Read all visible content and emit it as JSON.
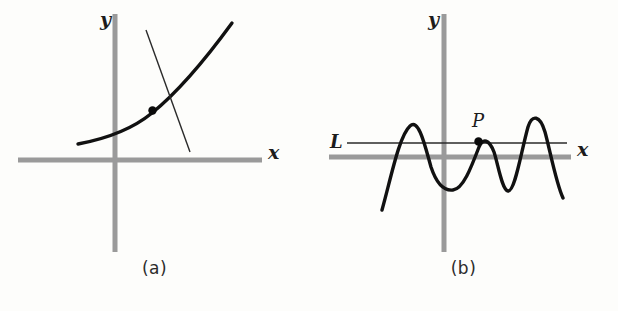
{
  "figure": {
    "background_color": "#fdfdfb",
    "axis_color": "#9a9a9a",
    "curve_color": "#111111",
    "line_color": "#2a2a2a",
    "panels": [
      {
        "id": "a",
        "caption": "(a)",
        "x_axis_label": "x",
        "y_axis_label": "y",
        "origin": [
          115,
          160
        ],
        "x_axis": {
          "x1": 18,
          "x2": 262,
          "y": 160
        },
        "y_axis": {
          "x": 115,
          "y1": 14,
          "y2": 252
        },
        "curve": {
          "name": "exponential-curve",
          "description": "increasing convex curve",
          "points": [
            [
              78,
              144
            ],
            [
              110,
              137
            ],
            [
              140,
              125
            ],
            [
              165,
              108
            ],
            [
              190,
              85
            ],
            [
              212,
              56
            ],
            [
              232,
              23
            ]
          ]
        },
        "secant_line": {
          "name": "transversal-line",
          "x1": 146,
          "y1": 30,
          "x2": 190,
          "y2": 152
        },
        "marked_points": [
          {
            "name": "intersection-point",
            "label": "",
            "x": 152,
            "y": 110
          }
        ]
      },
      {
        "id": "b",
        "caption": "(b)",
        "x_axis_label": "x",
        "y_axis_label": "y",
        "origin": [
          135,
          157
        ],
        "x_axis": {
          "x1": 20,
          "x2": 262,
          "y": 157
        },
        "y_axis": {
          "x": 135,
          "y1": 14,
          "y2": 252
        },
        "horizontal_line": {
          "name": "line-L",
          "label": "L",
          "y": 143,
          "x1": 38,
          "x2": 258,
          "label_x": 24,
          "label_y": 134
        },
        "curve": {
          "name": "oscillating-wave-curve",
          "description": "wave with three peaks and two troughs crossing line L",
          "points": [
            [
              73,
              210
            ],
            [
              80,
              185
            ],
            [
              88,
              155
            ],
            [
              95,
              133
            ],
            [
              100,
              126
            ],
            [
              106,
              129
            ],
            [
              112,
              142
            ],
            [
              118,
              162
            ],
            [
              126,
              180
            ],
            [
              134,
              189
            ],
            [
              142,
              190
            ],
            [
              150,
              184
            ],
            [
              158,
              172
            ],
            [
              165,
              158
            ],
            [
              170,
              147
            ],
            [
              176,
              140
            ],
            [
              181,
              142
            ],
            [
              186,
              152
            ],
            [
              190,
              170
            ],
            [
              194,
              186
            ],
            [
              198,
              191
            ],
            [
              203,
              186
            ],
            [
              208,
              170
            ],
            [
              213,
              148
            ],
            [
              218,
              128
            ],
            [
              223,
              119
            ],
            [
              228,
              118
            ],
            [
              233,
              126
            ],
            [
              238,
              142
            ],
            [
              244,
              164
            ],
            [
              250,
              186
            ],
            [
              254,
              198
            ]
          ]
        },
        "marked_points": [
          {
            "name": "point-P",
            "label": "P",
            "x": 169,
            "y": 142,
            "label_x": 164,
            "label_y": 113
          }
        ]
      }
    ]
  }
}
